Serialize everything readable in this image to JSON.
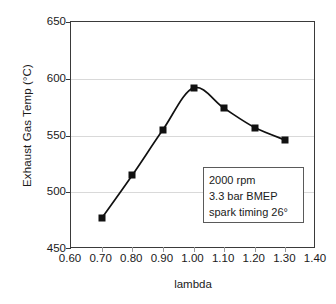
{
  "chart_data": {
    "type": "line",
    "title": "",
    "xlabel": "lambda",
    "ylabel": "Exhaust Gas Temp (°C)",
    "xlim": [
      0.6,
      1.4
    ],
    "ylim": [
      450,
      650
    ],
    "grid": true,
    "legend": "none",
    "marker": "filled-square",
    "line_color": "#111111",
    "xticks": [
      "0.60",
      "0.70",
      "0.80",
      "0.90",
      "1.00",
      "1.10",
      "1.20",
      "1.30",
      "1.40"
    ],
    "yticks": [
      "450",
      "500",
      "550",
      "600",
      "650"
    ],
    "x": [
      0.7,
      0.8,
      0.9,
      1.0,
      1.1,
      1.2,
      1.3
    ],
    "values": [
      477,
      515,
      555,
      592,
      574,
      557,
      546
    ],
    "series": [
      {
        "name": "Exhaust Gas Temp",
        "points": [
          {
            "x": 0.7,
            "y": 477
          },
          {
            "x": 0.8,
            "y": 515
          },
          {
            "x": 0.9,
            "y": 555
          },
          {
            "x": 1.0,
            "y": 592
          },
          {
            "x": 1.1,
            "y": 574
          },
          {
            "x": 1.2,
            "y": 557
          },
          {
            "x": 1.3,
            "y": 546
          }
        ]
      }
    ],
    "annotations": [
      {
        "name": "conditions-box",
        "lines": [
          "2000 rpm",
          "3.3 bar BMEP",
          "spark timing 26°"
        ]
      }
    ]
  }
}
